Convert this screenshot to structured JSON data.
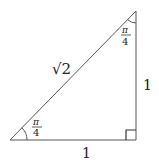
{
  "diagram": {
    "type": "right-triangle",
    "colors": {
      "stroke": "#444444",
      "text": "#222222",
      "background": "#ffffff"
    },
    "vertices": {
      "bottom_left": [
        10,
        140
      ],
      "right_angle": [
        136,
        140
      ],
      "top": [
        136,
        11
      ]
    },
    "labels": {
      "hypotenuse": "√2",
      "vertical_side": "1",
      "horizontal_side": "1",
      "angle_bottom_left": {
        "numerator": "π",
        "denominator": "4"
      },
      "angle_top": {
        "numerator": "π",
        "denominator": "4"
      }
    }
  }
}
